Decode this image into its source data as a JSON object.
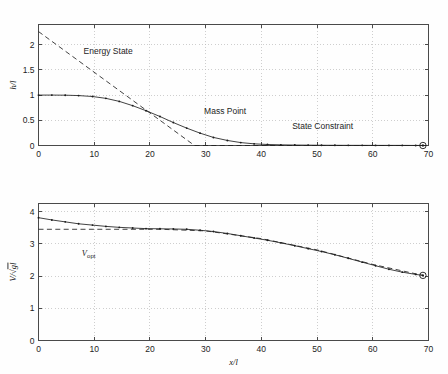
{
  "figure": {
    "background": "#fefefe",
    "line_color": "#202020",
    "grid_color": "#b9b9b9"
  },
  "chart_data": [
    {
      "type": "line",
      "id": "height-profile",
      "title": "",
      "xlabel": "",
      "ylabel": "h/l",
      "ylabel_parts": {
        "numerator": "h",
        "denominator": "l",
        "text": "h/l"
      },
      "xlim": [
        0,
        70
      ],
      "ylim": [
        0,
        2.4
      ],
      "xticks": [
        0,
        10,
        20,
        30,
        40,
        50,
        60,
        70
      ],
      "yticks": [
        0,
        0.5,
        1,
        1.5,
        2
      ],
      "ytick_labels": [
        "0",
        "0.5",
        "1",
        "1.5",
        "2"
      ],
      "xtick_labels": [
        "0",
        "10",
        "20",
        "30",
        "40",
        "50",
        "60",
        "70"
      ],
      "grid": true,
      "legend_position": "none",
      "annotations": [
        {
          "text": "Energy State",
          "x": 12.5,
          "y": 1.82
        },
        {
          "text": "Mass Point",
          "x": 33.5,
          "y": 0.62
        },
        {
          "text": "State Constraint",
          "x": 51.0,
          "y": 0.33
        }
      ],
      "series": [
        {
          "name": "Mass Point",
          "style": "solid",
          "markers": "dot",
          "x": [
            0,
            2.4,
            4.8,
            7.2,
            9.7,
            12.1,
            14.5,
            16.9,
            19.3,
            21.8,
            24.2,
            26.6,
            29.0,
            31.4,
            33.9,
            36.3,
            38.7,
            41.1,
            43.5,
            46.0,
            48.4,
            50.8,
            53.2,
            55.6,
            58.1,
            60.5,
            62.9,
            65.3,
            67.7,
            69.0
          ],
          "y": [
            1.0,
            1.0,
            0.998,
            0.99,
            0.972,
            0.935,
            0.875,
            0.79,
            0.69,
            0.575,
            0.455,
            0.345,
            0.245,
            0.16,
            0.1,
            0.058,
            0.033,
            0.02,
            0.013,
            0.009,
            0.007,
            0.005,
            0.004,
            0.003,
            0.003,
            0.002,
            0.002,
            0.002,
            0.001,
            0.001
          ]
        },
        {
          "name": "Energy State",
          "style": "dashed",
          "markers": "none",
          "x": [
            0,
            28.0,
            70.0
          ],
          "y": [
            2.26,
            0.0,
            0.0
          ]
        }
      ],
      "end_marker": {
        "x": 69.0,
        "y": 0.0,
        "shape": "circle-dot"
      }
    },
    {
      "type": "line",
      "id": "velocity-profile",
      "title": "",
      "xlabel": "x/l",
      "ylabel": "V/√(gl)",
      "ylabel_parts": {
        "numerator": "V",
        "radicand": "gl",
        "text": "V/√(gl)"
      },
      "xlim": [
        0,
        70
      ],
      "ylim": [
        0,
        4.25
      ],
      "xticks": [
        0,
        10,
        20,
        30,
        40,
        50,
        60,
        70
      ],
      "yticks": [
        0,
        1,
        2,
        3,
        4
      ],
      "ytick_labels": [
        "0",
        "1",
        "2",
        "3",
        "4"
      ],
      "xtick_labels": [
        "0",
        "10",
        "20",
        "30",
        "40",
        "50",
        "60",
        "70"
      ],
      "grid": true,
      "legend_position": "none",
      "annotations": [
        {
          "text": "V_opt",
          "x": 9.0,
          "y": 2.62,
          "label_main": "V",
          "label_sub": "opt"
        }
      ],
      "series": [
        {
          "name": "Velocity",
          "style": "solid",
          "markers": "dot",
          "x": [
            0,
            2.4,
            4.8,
            7.2,
            9.7,
            12.1,
            14.5,
            16.9,
            19.3,
            21.8,
            24.2,
            26.6,
            29.0,
            31.4,
            33.9,
            36.3,
            38.7,
            41.1,
            43.5,
            46.0,
            48.4,
            50.8,
            53.2,
            55.6,
            58.1,
            60.5,
            62.9,
            65.3,
            67.7,
            69.0
          ],
          "y": [
            3.81,
            3.74,
            3.68,
            3.62,
            3.58,
            3.54,
            3.51,
            3.49,
            3.47,
            3.465,
            3.46,
            3.45,
            3.42,
            3.38,
            3.32,
            3.25,
            3.18,
            3.11,
            3.03,
            2.94,
            2.85,
            2.76,
            2.66,
            2.55,
            2.43,
            2.32,
            2.21,
            2.12,
            2.05,
            2.02
          ]
        },
        {
          "name": "V_opt",
          "style": "dashed",
          "markers": "none",
          "x": [
            0,
            22.0,
            30.0,
            40.0,
            50.0,
            60.0,
            69.0
          ],
          "y": [
            3.45,
            3.45,
            3.4,
            3.16,
            2.81,
            2.36,
            2.02
          ]
        }
      ],
      "end_marker": {
        "x": 69.0,
        "y": 2.02,
        "shape": "circle-dot"
      }
    }
  ]
}
